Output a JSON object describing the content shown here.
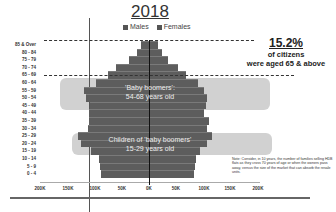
{
  "chart_data": {
    "type": "bar",
    "orientation": "horizontal-population-pyramid",
    "title": "2018",
    "legend": [
      "Males",
      "Females"
    ],
    "categories": [
      "85 & Over",
      "80 - 84",
      "75 - 79",
      "70 - 74",
      "65 - 69",
      "60 - 64",
      "55 - 59",
      "50 - 54",
      "45 - 49",
      "40 - 44",
      "35 - 39",
      "30 - 34",
      "25 - 29",
      "20 - 24",
      "15 - 19",
      "10 - 14",
      "5 - 9",
      "0 - 4"
    ],
    "series": [
      {
        "name": "Males",
        "values": [
          15,
          22,
          37,
          61,
          76,
          98,
          120,
          117,
          109,
          111,
          111,
          113,
          131,
          126,
          107,
          93,
          91,
          89
        ]
      },
      {
        "name": "Females",
        "values": [
          17,
          24,
          35,
          54,
          69,
          91,
          102,
          107,
          106,
          102,
          111,
          107,
          117,
          107,
          94,
          87,
          85,
          83
        ]
      }
    ],
    "units": "thousands",
    "xlabel": "",
    "ylabel": "",
    "xticks": [
      "200K",
      "150K",
      "100K",
      "50K",
      "0K",
      "50K",
      "100K",
      "150K",
      "200K"
    ],
    "xlim": [
      -200,
      200
    ],
    "grid": false,
    "legend_position": "top",
    "annotations": [
      {
        "text": "15.2%",
        "subtext": "of citizens were aged 65 & above"
      },
      {
        "text": "'Baby boomers': 54-68 years old"
      },
      {
        "text": "Children of 'baby boomers' 15-29 years old"
      },
      {
        "text": "Note: Consider, in 10 years, the number of families selling HDB flats as they cross 70 years of age or when the owners pass away, versus the size of the market that can absorb the resale units."
      }
    ]
  },
  "labels": {
    "title": "2018",
    "legend_males": "Males",
    "legend_females": "Females",
    "stat_pct": "15.2%",
    "stat_line1": "of citizens",
    "stat_line2": "were aged 65 & above",
    "boomers_line1": "'Baby boomers':",
    "boomers_line2": "54-68 years old",
    "children_line1": "Children of 'baby boomers'",
    "children_line2": "15-29 years old",
    "note": "Note: Consider, in 10 years, the number of families selling HDB flats as they cross 70 years of age or when the owners pass away, versus the size of the market that can absorb the resale units."
  },
  "colors": {
    "bar": "#5d5d5d",
    "highlight": "#c9c9c9"
  }
}
